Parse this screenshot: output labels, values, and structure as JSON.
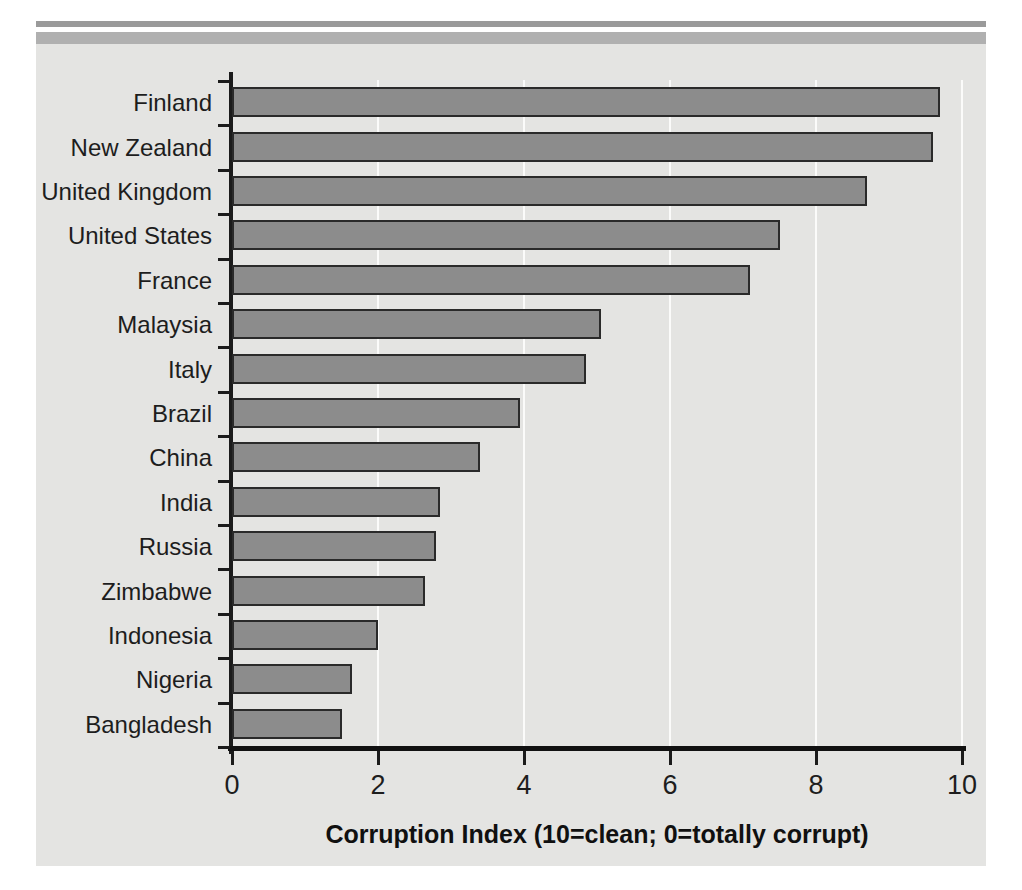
{
  "chart_data": {
    "type": "bar",
    "orientation": "horizontal",
    "title": "",
    "xlabel": "Corruption Index (10=clean; 0=totally corrupt)",
    "ylabel": "",
    "xlim": [
      0,
      10
    ],
    "xticks": [
      "0",
      "2",
      "4",
      "6",
      "8",
      "10"
    ],
    "xtick_values": [
      0,
      2,
      4,
      6,
      8,
      10
    ],
    "grid": "vertical",
    "legend": "none",
    "bar_fill_color": "#8c8c8c",
    "bar_edge_color": "#2a2a2a",
    "plot_background_color": "#e4e4e2",
    "gridline_color": "#fbfbfa",
    "axis_color": "#1b1b1b",
    "categories": [
      "Finland",
      "New Zealand",
      "United Kingdom",
      "United States",
      "France",
      "Malaysia",
      "Italy",
      "Brazil",
      "China",
      "India",
      "Russia",
      "Zimbabwe",
      "Indonesia",
      "Nigeria",
      "Bangladesh"
    ],
    "values": [
      9.7,
      9.6,
      8.7,
      7.5,
      7.1,
      5.05,
      4.85,
      3.95,
      3.4,
      2.85,
      2.8,
      2.65,
      2.0,
      1.65,
      1.5
    ]
  }
}
